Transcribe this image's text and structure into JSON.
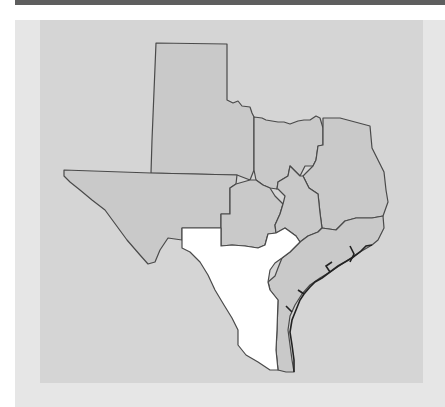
{
  "map": {
    "subject": "Texas regions",
    "colors": {
      "top_bar": "#5e5e5e",
      "outer_panel": "#e6e6e6",
      "map_panel": "#d5d5d5",
      "region_fill": "#c9c9c9",
      "highlight_fill": "#ffffff",
      "border": "#4a4a4a"
    },
    "regions": [
      {
        "id": "panhandle",
        "highlighted": false
      },
      {
        "id": "far-west",
        "highlighted": false
      },
      {
        "id": "north-central",
        "highlighted": false
      },
      {
        "id": "northeast",
        "highlighted": false
      },
      {
        "id": "west-central",
        "highlighted": false
      },
      {
        "id": "central",
        "highlighted": false
      },
      {
        "id": "central-east",
        "highlighted": false
      },
      {
        "id": "east",
        "highlighted": false
      },
      {
        "id": "southeast",
        "highlighted": false
      },
      {
        "id": "gulf-coast",
        "highlighted": false
      },
      {
        "id": "south-texas",
        "highlighted": true
      }
    ]
  }
}
